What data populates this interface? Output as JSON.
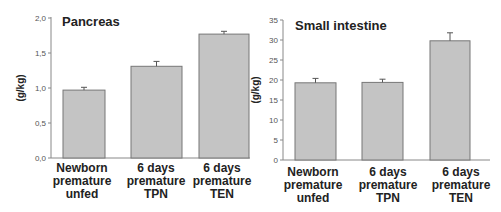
{
  "chart_data": [
    {
      "type": "bar",
      "title": "Pancreas",
      "xlabel": "",
      "ylabel": "(g/kg)",
      "ylim": [
        0,
        2.0
      ],
      "yticks": [
        "0,0",
        "0,5",
        "1,0",
        "1,5",
        "2,0"
      ],
      "ytick_values": [
        0,
        0.5,
        1.0,
        1.5,
        2.0
      ],
      "grid": false,
      "legend": null,
      "categories": [
        [
          "Newborn",
          "premature",
          "unfed"
        ],
        [
          "6 days",
          "premature",
          "TPN"
        ],
        [
          "6 days",
          "premature",
          "TEN"
        ]
      ],
      "values": [
        0.97,
        1.31,
        1.77
      ],
      "errors": [
        0.04,
        0.07,
        0.04
      ],
      "bar_color": "#c4c4c4"
    },
    {
      "type": "bar",
      "title": "Small intestine",
      "xlabel": "",
      "ylabel": "(g/kg)",
      "ylim": [
        0,
        35
      ],
      "yticks": [
        "0",
        "5",
        "10",
        "15",
        "20",
        "25",
        "30",
        "35"
      ],
      "ytick_values": [
        0,
        5,
        10,
        15,
        20,
        25,
        30,
        35
      ],
      "grid": false,
      "legend": null,
      "categories": [
        [
          "Newborn",
          "premature",
          "unfed"
        ],
        [
          "6 days",
          "premature",
          "TPN"
        ],
        [
          "6 days",
          "premature",
          "TEN"
        ]
      ],
      "values": [
        19.3,
        19.4,
        29.8
      ],
      "errors": [
        1.1,
        0.8,
        2.0
      ],
      "bar_color": "#c4c4c4"
    }
  ]
}
